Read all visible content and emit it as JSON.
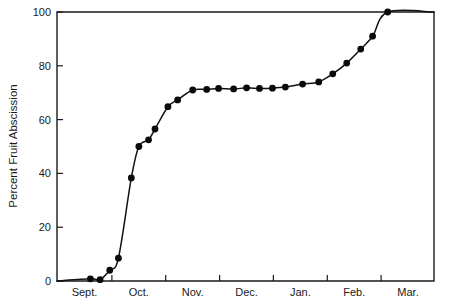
{
  "chart_data": {
    "type": "line",
    "title": "",
    "xlabel": "",
    "ylabel": "Percent Fruit Abscission",
    "ylim": [
      0,
      100
    ],
    "xlim": [
      0,
      7
    ],
    "grid": false,
    "legend": null,
    "yticks": [
      0,
      20,
      40,
      60,
      80,
      100
    ],
    "ytick_labels": [
      "0",
      "20",
      "40",
      "60",
      "80",
      "100"
    ],
    "xtick_labels": [
      "Sept.",
      "Oct.",
      "Nov.",
      "Dec.",
      "Jan.",
      "Feb.",
      "Mar."
    ],
    "marker": "filled-circle",
    "series": [
      {
        "name": "Percent Fruit Abscission",
        "x": [
          0.62,
          0.78,
          0.95,
          1.12,
          1.3,
          1.45,
          1.6,
          1.72,
          1.85,
          2.0,
          2.18,
          2.38,
          2.6,
          2.85,
          3.08,
          3.32,
          3.58,
          3.85,
          4.12,
          4.38,
          4.62,
          4.92,
          5.22,
          5.52,
          5.8,
          6.05,
          6.28,
          6.52,
          6.75,
          7.0
        ],
        "values": [
          0.8,
          0.5,
          4.0,
          8.5,
          38.3,
          50.0,
          52.5,
          56.5,
          64.8,
          67.3,
          71.0,
          71.2,
          71.5,
          71.3,
          71.8,
          71.7,
          71.6,
          71.9,
          72.1,
          73.2,
          74.0,
          77.0,
          81.0,
          86.2,
          91.0,
          100.0,
          100.0,
          100.0,
          100.0,
          100.0
        ]
      }
    ],
    "points": [
      {
        "x": 0.62,
        "y": 0.8
      },
      {
        "x": 0.8,
        "y": 0.5
      },
      {
        "x": 0.98,
        "y": 4.0
      },
      {
        "x": 1.14,
        "y": 8.5
      },
      {
        "x": 1.38,
        "y": 38.3
      },
      {
        "x": 1.52,
        "y": 50.0
      },
      {
        "x": 1.7,
        "y": 52.5
      },
      {
        "x": 1.82,
        "y": 56.5
      },
      {
        "x": 2.06,
        "y": 64.8
      },
      {
        "x": 2.24,
        "y": 67.3
      },
      {
        "x": 2.52,
        "y": 71.0
      },
      {
        "x": 2.78,
        "y": 71.2
      },
      {
        "x": 3.0,
        "y": 71.6
      },
      {
        "x": 3.28,
        "y": 71.4
      },
      {
        "x": 3.52,
        "y": 71.8
      },
      {
        "x": 3.76,
        "y": 71.6
      },
      {
        "x": 4.0,
        "y": 71.7
      },
      {
        "x": 4.24,
        "y": 72.1
      },
      {
        "x": 4.56,
        "y": 73.2
      },
      {
        "x": 4.86,
        "y": 74.0
      },
      {
        "x": 5.12,
        "y": 77.0
      },
      {
        "x": 5.38,
        "y": 81.0
      },
      {
        "x": 5.64,
        "y": 86.2
      },
      {
        "x": 5.86,
        "y": 91.0
      },
      {
        "x": 6.14,
        "y": 100.0
      }
    ]
  },
  "axes": {
    "y_axis_title": "Percent Fruit Abscission",
    "y_tick_values": [
      "100",
      "80",
      "60",
      "40",
      "20",
      "0"
    ],
    "x_tick_values": [
      "Sept.",
      "Oct.",
      "Nov.",
      "Dec.",
      "Jan.",
      "Feb.",
      "Mar."
    ]
  },
  "colors": {
    "line": "#111111",
    "marker": "#0a0a0a",
    "axis": "#1a1a1a",
    "background": "#ffffff"
  }
}
